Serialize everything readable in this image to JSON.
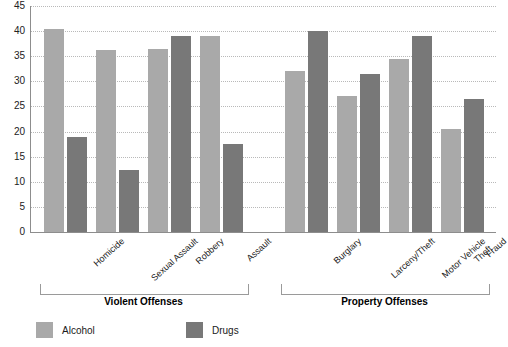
{
  "chart_data": {
    "type": "bar",
    "title": "",
    "xlabel": "",
    "ylabel": "",
    "ylim": [
      0,
      45
    ],
    "ytick_step": 5,
    "yticks": [
      45,
      40,
      35,
      30,
      25,
      20,
      15,
      10,
      5,
      0
    ],
    "grid": true,
    "legend_position": "bottom",
    "categories": [
      "Homicide",
      "Sexual Assault",
      "Robbery",
      "Assault",
      "Burglary",
      "Larceny/Theft",
      "Motor Vehicle Theft",
      "Fraud"
    ],
    "series": [
      {
        "name": "Alcohol",
        "color": "#a9a9a9",
        "values": [
          40.5,
          36.3,
          36.5,
          39.0,
          32.0,
          27.0,
          34.5,
          20.5
        ]
      },
      {
        "name": "Drugs",
        "color": "#787878",
        "values": [
          19.0,
          12.3,
          39.0,
          17.5,
          40.0,
          31.5,
          39.0,
          26.5
        ]
      }
    ],
    "groups": [
      {
        "label": "Violent Offenses",
        "categories": [
          "Homicide",
          "Sexual Assault",
          "Robbery",
          "Assault"
        ]
      },
      {
        "label": "Property Offenses",
        "categories": [
          "Burglary",
          "Larceny/Theft",
          "Motor Vehicle Theft",
          "Fraud"
        ]
      }
    ]
  },
  "axis": {
    "ytick_labels": [
      "45",
      "40",
      "35",
      "30",
      "25",
      "20",
      "15",
      "10",
      "5",
      "0"
    ]
  },
  "categories_display": [
    {
      "line1": "Homicide",
      "line2": ""
    },
    {
      "line1": "Sexual Assault",
      "line2": ""
    },
    {
      "line1": "Robbery",
      "line2": ""
    },
    {
      "line1": "Assault",
      "line2": ""
    },
    {
      "line1": "Burglary",
      "line2": ""
    },
    {
      "line1": "Larceny/Theft",
      "line2": ""
    },
    {
      "line1": "Motor Vehicle",
      "line2": "Theft"
    },
    {
      "line1": "Fraud",
      "line2": ""
    }
  ],
  "groups_display": [
    {
      "label": "Violent Offenses"
    },
    {
      "label": "Property Offenses"
    }
  ],
  "legend": {
    "items": [
      {
        "label": "Alcohol",
        "color": "#a9a9a9"
      },
      {
        "label": "Drugs",
        "color": "#787878"
      }
    ]
  },
  "title_fragment": ""
}
